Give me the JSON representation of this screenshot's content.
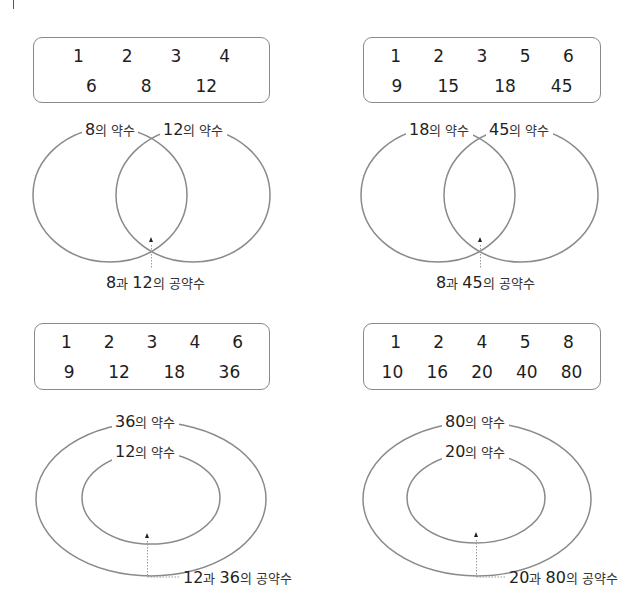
{
  "panels": [
    {
      "id": "top-left",
      "type": "venn",
      "box_rows": [
        [
          "1",
          "2",
          "3",
          "4"
        ],
        [
          "6",
          "8",
          "12"
        ]
      ],
      "set_a_label": {
        "num": "8",
        "suffix": "의 약수"
      },
      "set_b_label": {
        "num": "12",
        "suffix": "의 약수"
      },
      "common_label": {
        "a": "8",
        "join": "과 ",
        "b": "12",
        "suffix": "의 공약수"
      }
    },
    {
      "id": "top-right",
      "type": "venn",
      "box_rows": [
        [
          "1",
          "2",
          "3",
          "5",
          "6"
        ],
        [
          "9",
          "15",
          "18",
          "45"
        ]
      ],
      "set_a_label": {
        "num": "18",
        "suffix": "의 약수"
      },
      "set_b_label": {
        "num": "45",
        "suffix": "의 약수"
      },
      "common_label": {
        "a": "8",
        "join": "과 ",
        "b": "45",
        "suffix": "의 공약수"
      }
    },
    {
      "id": "bottom-left",
      "type": "nested",
      "box_rows": [
        [
          "1",
          "2",
          "3",
          "4",
          "6"
        ],
        [
          "9",
          "12",
          "18",
          "36"
        ]
      ],
      "outer_label": {
        "num": "36",
        "suffix": "의 약수"
      },
      "inner_label": {
        "num": "12",
        "suffix": "의 약수"
      },
      "common_label": {
        "a": "12",
        "join": "과 ",
        "b": "36",
        "suffix": "의 공약수"
      }
    },
    {
      "id": "bottom-right",
      "type": "nested",
      "box_rows": [
        [
          "1",
          "2",
          "4",
          "5",
          "8"
        ],
        [
          "10",
          "16",
          "20",
          "40",
          "80"
        ]
      ],
      "outer_label": {
        "num": "80",
        "suffix": "의 약수"
      },
      "inner_label": {
        "num": "20",
        "suffix": "의 약수"
      },
      "common_label": {
        "a": "20",
        "join": "과 ",
        "b": "80",
        "suffix": "의 공약수"
      }
    }
  ],
  "colors": {
    "line": "#8a8a8a",
    "text": "#222222",
    "dotted": "#9a9a9a"
  }
}
